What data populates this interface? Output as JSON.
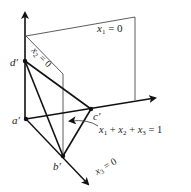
{
  "diagram": {
    "type": "3d-simplex-planes",
    "points": {
      "a": {
        "label": "a′",
        "x": 26,
        "y": 119
      },
      "b": {
        "label": "b′",
        "x": 63,
        "y": 156
      },
      "c": {
        "label": "c′",
        "x": 91,
        "y": 109
      },
      "d": {
        "label": "d′",
        "x": 25,
        "y": 61
      }
    },
    "planes": {
      "x1": {
        "label_var": "x",
        "label_sub": "1",
        "label_rest": " = 0"
      },
      "x2": {
        "label_var": "x",
        "label_sub": "2",
        "label_rest": " = 0"
      },
      "x3": {
        "label_var": "x",
        "label_sub": "3",
        "label_rest": " = 0"
      }
    },
    "simplex_equation": {
      "parts": [
        "x",
        "1",
        " + ",
        "x",
        "2",
        " + ",
        "x",
        "3",
        " = 1"
      ]
    },
    "colors": {
      "line": "#111111",
      "thin_line": "#333333"
    }
  }
}
